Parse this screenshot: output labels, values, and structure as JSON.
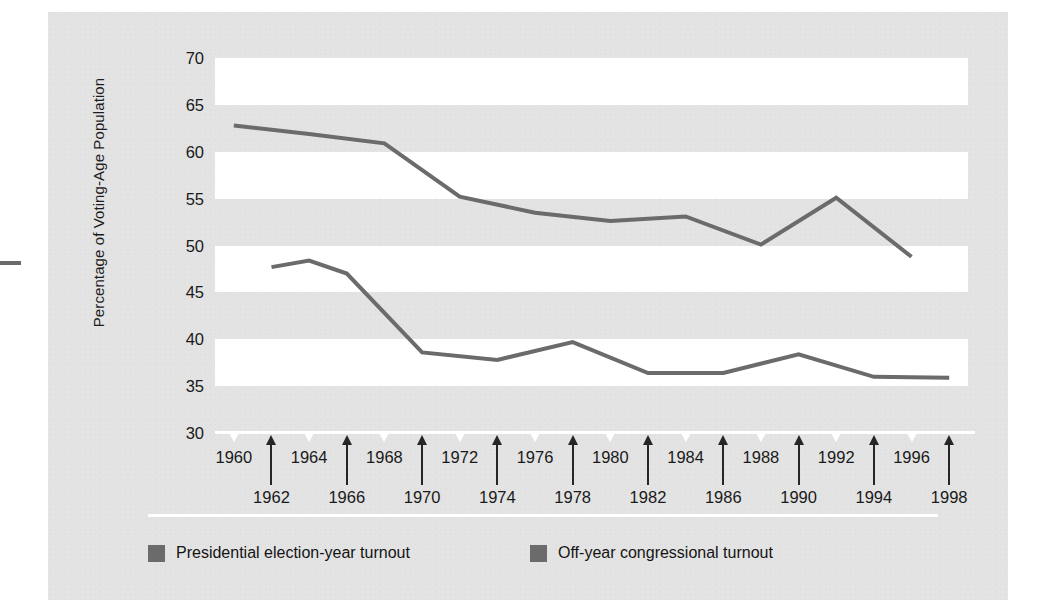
{
  "figure": {
    "y_axis_title": "Percentage of Voting-Age Population"
  },
  "legend": {
    "items": [
      {
        "label": "Presidential election-year turnout",
        "color": "#6b6b6b"
      },
      {
        "label": "Off-year congressional turnout",
        "color": "#6b6b6b"
      }
    ]
  },
  "chart_data": {
    "type": "line",
    "title": "",
    "xlabel": "",
    "ylabel": "Percentage of Voting-Age Population",
    "xlim": [
      1959,
      1999
    ],
    "ylim": [
      30,
      70
    ],
    "ytick_labels": [
      "70",
      "65",
      "60",
      "55",
      "50",
      "45",
      "40",
      "35",
      "30"
    ],
    "yticks": [
      70,
      65,
      60,
      55,
      50,
      45,
      40,
      35,
      30
    ],
    "xtick_labels_top": [
      "1960",
      "1964",
      "1968",
      "1972",
      "1976",
      "1980",
      "1984",
      "1988",
      "1992",
      "1996"
    ],
    "xtick_labels_bottom": [
      "1962",
      "1966",
      "1970",
      "1974",
      "1978",
      "1982",
      "1986",
      "1990",
      "1994",
      "1998"
    ],
    "grid": "alternating-horizontal-bands",
    "legend_position": "bottom",
    "line_color": "#6b6b6b",
    "series": [
      {
        "name": "Presidential election-year turnout",
        "x": [
          1960,
          1964,
          1968,
          1972,
          1976,
          1980,
          1984,
          1988,
          1992,
          1996
        ],
        "values": [
          62.8,
          61.9,
          60.9,
          55.2,
          53.5,
          52.6,
          53.1,
          50.1,
          55.1,
          48.8
        ]
      },
      {
        "name": "Off-year congressional turnout",
        "x": [
          1962,
          1966,
          1970,
          1974,
          1978,
          1982,
          1986,
          1990,
          1994,
          1998
        ],
        "values": [
          47.7,
          47.0,
          38.6,
          37.8,
          39.7,
          36.4,
          36.4,
          38.4,
          36.0,
          35.9
        ],
        "note_interior_peak": {
          "x": 1964,
          "value": 48.4
        }
      }
    ]
  }
}
